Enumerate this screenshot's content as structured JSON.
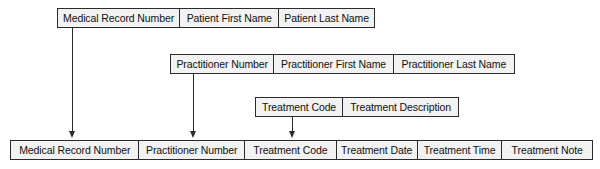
{
  "diagram": {
    "type": "database-schema-relation-diagram",
    "colors": {
      "background": "#ffffff",
      "box_fill": "#f2f2f2",
      "box_border": "#2b2b2b",
      "line": "#2b2b2b",
      "text": "#101010"
    },
    "relations": [
      {
        "id": "patient",
        "name": "Patient relation",
        "attributes": [
          "Medical Record Number",
          "Patient First Name",
          "Patient Last Name"
        ]
      },
      {
        "id": "practitioner",
        "name": "Practitioner relation",
        "attributes": [
          "Practitioner Number",
          "Practitioner First Name",
          "Practitioner Last Name"
        ]
      },
      {
        "id": "treatment",
        "name": "Treatment relation",
        "attributes": [
          "Treatment Code",
          "Treatment Description"
        ]
      },
      {
        "id": "treatment-record",
        "name": "Treatment record relation",
        "attributes": [
          "Medical Record Number",
          "Practitioner Number",
          "Treatment Code",
          "Treatment Date",
          "Treatment Time",
          "Treatment Note"
        ]
      }
    ],
    "connectors": [
      {
        "id": "mrn-link",
        "name": "medical-record-number-foreign-key-link",
        "from": "Medical Record Number",
        "to": "Medical Record Number"
      },
      {
        "id": "practitioner-link",
        "name": "practitioner-number-foreign-key-link",
        "from": "Practitioner Number",
        "to": "Practitioner Number"
      },
      {
        "id": "treatment-link",
        "name": "treatment-code-foreign-key-link",
        "from": "Treatment Code",
        "to": "Treatment Code"
      }
    ]
  }
}
